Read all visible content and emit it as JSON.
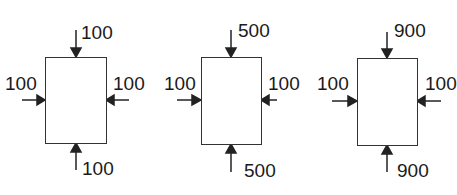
{
  "diagram": {
    "colors": {
      "stroke": "#333333",
      "text": "#1a1a1a",
      "background": "#ffffff"
    },
    "panels": [
      {
        "top": "100",
        "bottom": "100",
        "left": "100",
        "right": "100"
      },
      {
        "top": "500",
        "bottom": "500",
        "left": "100",
        "right": "100"
      },
      {
        "top": "900",
        "bottom": "900",
        "left": "100",
        "right": "100"
      }
    ]
  }
}
